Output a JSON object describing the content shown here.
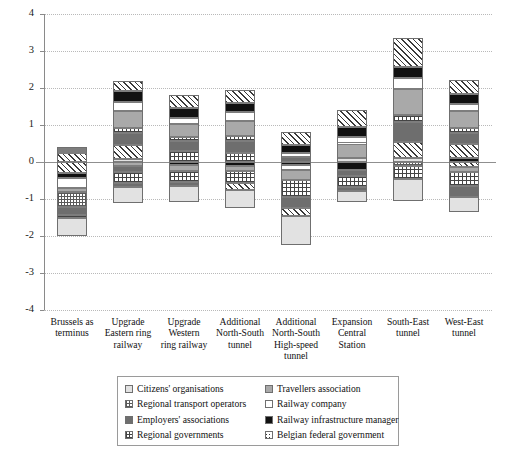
{
  "chart_data": {
    "type": "bar",
    "stacked": true,
    "title": "",
    "xlabel": "",
    "ylabel": "",
    "ylim": [
      -4,
      4
    ],
    "yticks": [
      4,
      3,
      2,
      1,
      0,
      -1,
      -2,
      -3,
      -4
    ],
    "ytick_labels": [
      "4",
      "3",
      "2",
      "1",
      "0",
      "-1",
      "-2",
      "-3",
      "-4"
    ],
    "grid": true,
    "legend_position": "below-axis",
    "categories": [
      "Brussels as terminus",
      "Upgrade Eastern ring railway",
      "Upgrade Western ring railway",
      "Additional North-South tunnel",
      "Additional North-South High-speed tunnel",
      "Expansion Central Station",
      "South-East tunnel",
      "West-East tunnel"
    ],
    "category_lines": [
      [
        "Brussels as",
        "terminus"
      ],
      [
        "Upgrade",
        "Eastern ring",
        "railway"
      ],
      [
        "Upgrade",
        "Western",
        "ring railway"
      ],
      [
        "Additional",
        "North-South",
        "tunnel"
      ],
      [
        "Additional",
        "North-South",
        "High-speed",
        "tunnel"
      ],
      [
        "Expansion",
        "Central",
        "Station"
      ],
      [
        "South-East",
        "tunnel"
      ],
      [
        "West-East",
        "tunnel"
      ]
    ],
    "series": [
      {
        "name": "Citizens' organisations",
        "pattern": "light-grey-plain",
        "values": [
          -0.85,
          -0.5,
          -0.45,
          -0.55,
          -0.85,
          -0.5,
          -0.55,
          -0.2
        ]
      },
      {
        "name": "Travellers association",
        "pattern": "medium-grey-plain",
        "values": [
          -0.3,
          0.45,
          0.45,
          0.6,
          0.55,
          0.45,
          0.65,
          0.55
        ]
      },
      {
        "name": "Regional transport operators",
        "pattern": "fine-dot-grid",
        "values": [
          -0.45,
          -0.25,
          -0.25,
          -0.3,
          -0.4,
          -0.25,
          -0.25,
          -0.35
        ]
      },
      {
        "name": "Railway company",
        "pattern": "white",
        "values": [
          -0.3,
          0.2,
          0.15,
          0.25,
          0.3,
          0.2,
          0.35,
          0.25
        ]
      },
      {
        "name": "Employers' associations",
        "pattern": "dark-grey-plain",
        "values": [
          -0.2,
          0.35,
          0.35,
          0.3,
          0.85,
          0.25,
          0.8,
          0.35
        ]
      },
      {
        "name": "Railway infrastructure manager",
        "pattern": "black",
        "values": [
          -0.2,
          0.35,
          0.3,
          0.3,
          0.2,
          0.25,
          0.35,
          0.3
        ]
      },
      {
        "name": "Regional governments",
        "pattern": "cross-hatch",
        "values": [
          0.15,
          0.15,
          0.15,
          0.3,
          0.15,
          0.15,
          0.2,
          0.25
        ]
      },
      {
        "name": "Belgian federal government",
        "pattern": "diagonal-hatch",
        "values": [
          0.45,
          0.5,
          0.4,
          0.5,
          0.55,
          0.4,
          0.9,
          0.45
        ]
      }
    ],
    "bars": [
      {
        "category": "Brussels as terminus",
        "positive_top": 0.4,
        "negative_bottom": -2.0,
        "pos_segments": [
          {
            "series": "Belgian federal government",
            "value": 0.23
          },
          {
            "series": "Regional governments",
            "value": 0.06
          },
          {
            "series": "Employers' associations",
            "value": 0.05
          },
          {
            "series": "Travellers association",
            "value": 0.06
          }
        ],
        "neg_segments": [
          {
            "series": "Belgian federal government",
            "value": -0.3
          },
          {
            "series": "Railway infrastructure manager",
            "value": -0.13
          },
          {
            "series": "Railway company",
            "value": -0.28
          },
          {
            "series": "Travellers association",
            "value": -0.1
          },
          {
            "series": "Regional transport operators",
            "value": -0.4
          },
          {
            "series": "Employers' associations",
            "value": -0.22
          },
          {
            "series": "Regional governments",
            "value": -0.09
          },
          {
            "series": "Citizens' organisations",
            "value": -0.48
          }
        ]
      },
      {
        "category": "Upgrade Eastern ring railway",
        "positive_top": 2.2,
        "negative_bottom": -1.1,
        "pos_segments": [
          {
            "series": "Citizens' organisations",
            "value": 0.07
          },
          {
            "series": "Belgian federal government",
            "value": 0.38
          },
          {
            "series": "Employers' associations",
            "value": 0.33
          },
          {
            "series": "Regional governments",
            "value": 0.13
          },
          {
            "series": "Travellers association",
            "value": 0.47
          },
          {
            "series": "Railway company",
            "value": 0.23
          },
          {
            "series": "Railway infrastructure manager",
            "value": 0.32
          },
          {
            "series": "Belgian federal government",
            "value": 0.27
          }
        ],
        "neg_segments": [
          {
            "series": "Travellers association",
            "value": -0.12
          },
          {
            "series": "Employers' associations",
            "value": -0.14
          },
          {
            "series": "Regional governments",
            "value": -0.31
          },
          {
            "series": "Employers' associations",
            "value": -0.1
          },
          {
            "series": "Citizens' organisations",
            "value": -0.43
          }
        ]
      },
      {
        "category": "Upgrade Western ring railway",
        "positive_top": 1.82,
        "negative_bottom": -1.08,
        "pos_segments": [
          {
            "series": "Regional governments",
            "value": 0.3
          },
          {
            "series": "Employers' associations",
            "value": 0.26
          },
          {
            "series": "Regional governments",
            "value": 0.12
          },
          {
            "series": "Travellers association",
            "value": 0.36
          },
          {
            "series": "Railway company",
            "value": 0.16
          },
          {
            "series": "Railway infrastructure manager",
            "value": 0.27
          },
          {
            "series": "Belgian federal government",
            "value": 0.35
          }
        ],
        "neg_segments": [
          {
            "series": "Railway infrastructure manager",
            "value": -0.08
          },
          {
            "series": "Travellers association",
            "value": -0.16
          },
          {
            "series": "Regional governments",
            "value": -0.3
          },
          {
            "series": "Employers' associations",
            "value": -0.12
          },
          {
            "series": "Citizens' organisations",
            "value": -0.42
          }
        ]
      },
      {
        "category": "Additional North-South tunnel",
        "positive_top": 1.95,
        "negative_bottom": -1.25,
        "pos_segments": [
          {
            "series": "Regional governments",
            "value": 0.25
          },
          {
            "series": "Employers' associations",
            "value": 0.33
          },
          {
            "series": "Regional governments",
            "value": 0.12
          },
          {
            "series": "Travellers association",
            "value": 0.42
          },
          {
            "series": "Railway company",
            "value": 0.22
          },
          {
            "series": "Railway infrastructure manager",
            "value": 0.26
          },
          {
            "series": "Belgian federal government",
            "value": 0.35
          }
        ],
        "neg_segments": [
          {
            "series": "Railway infrastructure manager",
            "value": -0.1
          },
          {
            "series": "Travellers association",
            "value": -0.14
          },
          {
            "series": "Regional governments",
            "value": -0.33
          },
          {
            "series": "Belgian federal government",
            "value": -0.2
          },
          {
            "series": "Citizens' organisations",
            "value": -0.48
          }
        ]
      },
      {
        "category": "Additional North-South High-speed tunnel",
        "positive_top": 0.8,
        "negative_bottom": -2.25,
        "pos_segments": [
          {
            "series": "Employers' associations",
            "value": 0.14
          },
          {
            "series": "Railway company",
            "value": 0.1
          },
          {
            "series": "Railway infrastructure manager",
            "value": 0.22
          },
          {
            "series": "Belgian federal government",
            "value": 0.34
          }
        ],
        "neg_segments": [
          {
            "series": "Railway infrastructure manager",
            "value": -0.09
          },
          {
            "series": "Railway company",
            "value": -0.13
          },
          {
            "series": "Travellers association",
            "value": -0.27
          },
          {
            "series": "Regional governments",
            "value": -0.46
          },
          {
            "series": "Employers' associations",
            "value": -0.3
          },
          {
            "series": "Belgian federal government",
            "value": -0.2
          },
          {
            "series": "Citizens' organisations",
            "value": -0.8
          }
        ]
      },
      {
        "category": "Expansion Central Station",
        "positive_top": 1.4,
        "negative_bottom": -1.08,
        "pos_segments": [
          {
            "series": "Citizens' organisations",
            "value": 0.12
          },
          {
            "series": "Travellers association",
            "value": 0.38
          },
          {
            "series": "Railway company",
            "value": 0.17
          },
          {
            "series": "Railway infrastructure manager",
            "value": 0.27
          },
          {
            "series": "Belgian federal government",
            "value": 0.46
          }
        ],
        "neg_segments": [
          {
            "series": "Railway infrastructure manager",
            "value": -0.22
          },
          {
            "series": "Employers' associations",
            "value": -0.16
          },
          {
            "series": "Regional governments",
            "value": -0.3
          },
          {
            "series": "Employers' associations",
            "value": -0.11
          },
          {
            "series": "Citizens' organisations",
            "value": -0.29
          }
        ]
      },
      {
        "category": "South-East tunnel",
        "positive_top": 3.35,
        "negative_bottom": -1.05,
        "pos_segments": [
          {
            "series": "Citizens' organisations",
            "value": 0.1
          },
          {
            "series": "Belgian federal government",
            "value": 0.45
          },
          {
            "series": "Employers' associations",
            "value": 0.53
          },
          {
            "series": "Regional governments",
            "value": 0.18
          },
          {
            "series": "Travellers association",
            "value": 0.72
          },
          {
            "series": "Railway company",
            "value": 0.28
          },
          {
            "series": "Railway infrastructure manager",
            "value": 0.32
          },
          {
            "series": "Belgian federal government",
            "value": 0.77
          }
        ],
        "neg_segments": [
          {
            "series": "Regional transport operators",
            "value": -0.12
          },
          {
            "series": "Regional governments",
            "value": -0.35
          },
          {
            "series": "Citizens' organisations",
            "value": -0.58
          }
        ]
      },
      {
        "category": "West-East tunnel",
        "positive_top": 2.22,
        "negative_bottom": -1.35,
        "pos_segments": [
          {
            "series": "Railway infrastructure manager",
            "value": 0.1
          },
          {
            "series": "Belgian federal government",
            "value": 0.38
          },
          {
            "series": "Employers' associations",
            "value": 0.3
          },
          {
            "series": "Regional governments",
            "value": 0.14
          },
          {
            "series": "Travellers association",
            "value": 0.45
          },
          {
            "series": "Railway company",
            "value": 0.2
          },
          {
            "series": "Railway infrastructure manager",
            "value": 0.27
          },
          {
            "series": "Belgian federal government",
            "value": 0.38
          }
        ],
        "neg_segments": [
          {
            "series": "Belgian federal government",
            "value": -0.14
          },
          {
            "series": "Travellers association",
            "value": -0.12
          },
          {
            "series": "Regional governments",
            "value": -0.4
          },
          {
            "series": "Employers' associations",
            "value": -0.28
          },
          {
            "series": "Citizens' organisations",
            "value": -0.41
          }
        ]
      }
    ]
  },
  "legend": {
    "entries": [
      {
        "label": "Citizens' organisations",
        "pattern": "light-grey-plain"
      },
      {
        "label": "Travellers association",
        "pattern": "medium-grey-plain"
      },
      {
        "label": "Regional transport operators",
        "pattern": "fine-dot-grid"
      },
      {
        "label": "Railway company",
        "pattern": "white"
      },
      {
        "label": "Employers' associations",
        "pattern": "dark-grey-plain"
      },
      {
        "label": "Railway infrastructure manager",
        "pattern": "black"
      },
      {
        "label": "Regional governments",
        "pattern": "cross-hatch"
      },
      {
        "label": "Belgian federal government",
        "pattern": "diagonal-hatch"
      }
    ]
  }
}
